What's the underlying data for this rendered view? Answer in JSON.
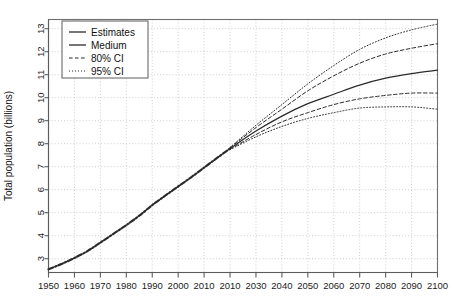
{
  "chart_data": {
    "type": "line",
    "title": "",
    "xlabel": "",
    "ylabel": "Total population (billions)",
    "xlim": [
      1950,
      2100
    ],
    "ylim": [
      2.4,
      13.4
    ],
    "grid": true,
    "legend_position": "top-left",
    "xticks": [
      1950,
      1960,
      1970,
      1980,
      1990,
      2000,
      2010,
      2010,
      2030,
      2040,
      2050,
      2060,
      2070,
      2080,
      2090,
      2100
    ],
    "xtick_values": [
      1950,
      1960,
      1970,
      1980,
      1990,
      2000,
      2010,
      2020,
      2030,
      2040,
      2050,
      2060,
      2070,
      2080,
      2090,
      2100
    ],
    "yticks": [
      3,
      4,
      5,
      6,
      7,
      8,
      9,
      10,
      11,
      12,
      13
    ],
    "legend": [
      {
        "label": "Estimates",
        "style": "solid"
      },
      {
        "label": "Medium",
        "style": "solid"
      },
      {
        "label": "80% CI",
        "style": "dashed"
      },
      {
        "label": "95% CI",
        "style": "dotted"
      }
    ],
    "series": [
      {
        "name": "Estimates",
        "style": "solid",
        "x": [
          1950,
          1955,
          1960,
          1965,
          1970,
          1975,
          1980,
          1985,
          1990,
          1995,
          2000,
          2005,
          2010,
          2015,
          2020
        ],
        "values": [
          2.54,
          2.77,
          3.03,
          3.33,
          3.7,
          4.08,
          4.46,
          4.87,
          5.33,
          5.74,
          6.14,
          6.54,
          6.96,
          7.38,
          7.79
        ]
      },
      {
        "name": "Medium",
        "style": "solid",
        "x": [
          2020,
          2030,
          2040,
          2050,
          2060,
          2070,
          2080,
          2090,
          2100
        ],
        "values": [
          7.79,
          8.55,
          9.2,
          9.74,
          10.15,
          10.55,
          10.85,
          11.05,
          11.2
        ]
      },
      {
        "name": "80% CI upper",
        "style": "dashed",
        "x": [
          2020,
          2030,
          2040,
          2050,
          2060,
          2070,
          2080,
          2090,
          2100
        ],
        "values": [
          7.82,
          8.7,
          9.5,
          10.3,
          10.95,
          11.5,
          11.9,
          12.15,
          12.35
        ]
      },
      {
        "name": "80% CI lower",
        "style": "dashed",
        "x": [
          2020,
          2030,
          2040,
          2050,
          2060,
          2070,
          2080,
          2090,
          2100
        ],
        "values": [
          7.76,
          8.4,
          8.95,
          9.35,
          9.7,
          9.95,
          10.1,
          10.2,
          10.2
        ]
      },
      {
        "name": "95% CI upper",
        "style": "dotted",
        "x": [
          2020,
          2030,
          2040,
          2050,
          2060,
          2070,
          2080,
          2090,
          2100
        ],
        "values": [
          7.84,
          8.8,
          9.7,
          10.6,
          11.4,
          12.1,
          12.6,
          12.95,
          13.2
        ]
      },
      {
        "name": "95% CI lower",
        "style": "dotted",
        "x": [
          2020,
          2030,
          2040,
          2050,
          2060,
          2070,
          2080,
          2090,
          2100
        ],
        "values": [
          7.74,
          8.3,
          8.75,
          9.1,
          9.35,
          9.55,
          9.6,
          9.6,
          9.5
        ]
      }
    ]
  }
}
